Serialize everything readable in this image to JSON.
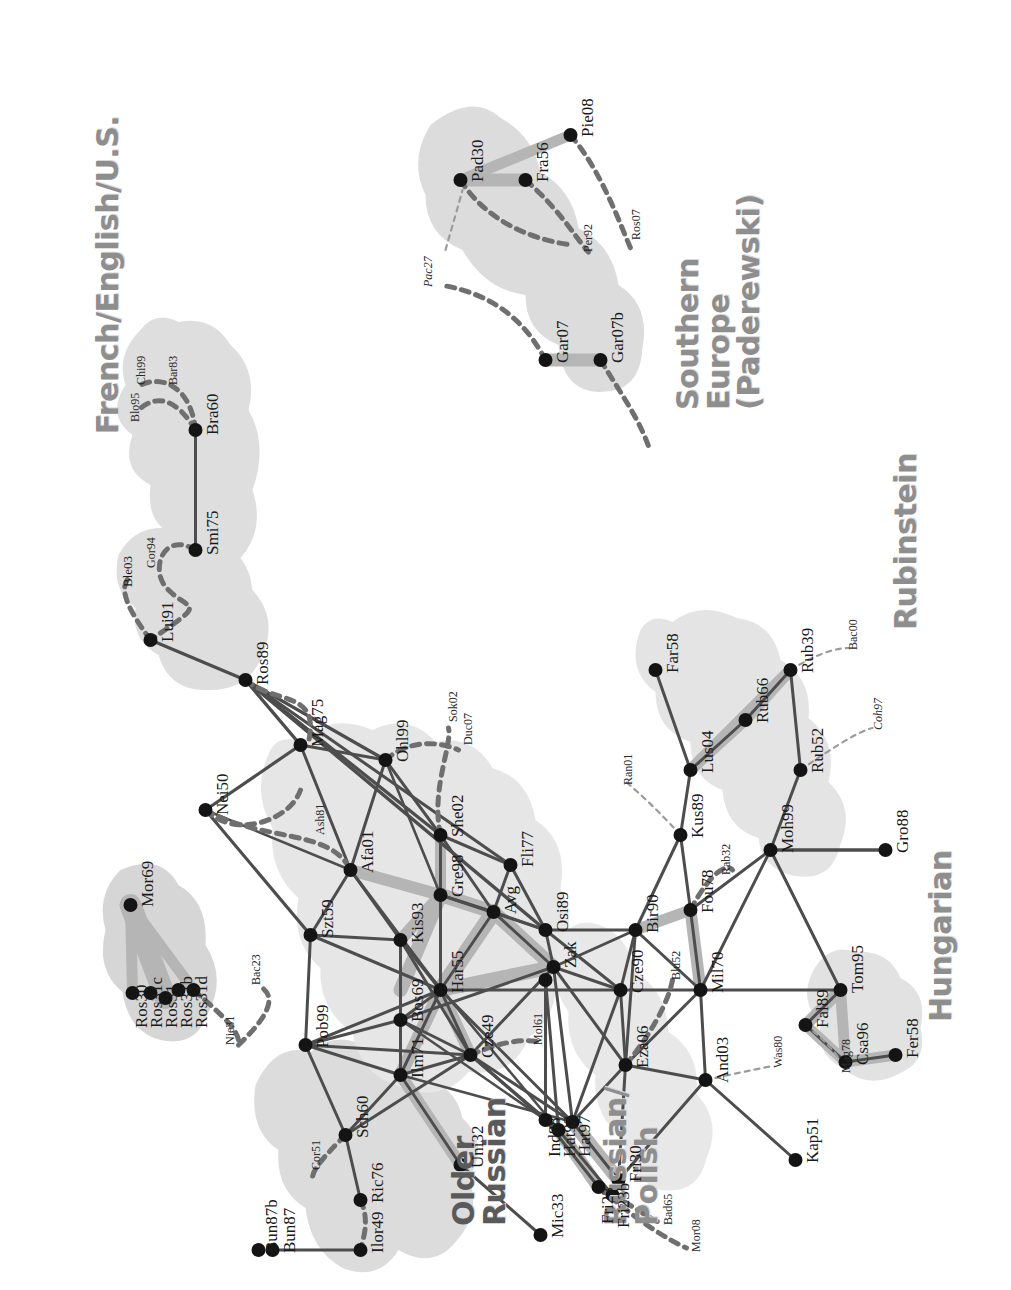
{
  "figure": {
    "type": "node-link-network-diagram",
    "orientation": "rotated-90-ccw",
    "background": "#ffffff",
    "palette": {
      "hull_light": "#e0e0e0",
      "hull_mid": "#d2d2d2",
      "hull_dark": "#c2c2c2",
      "edge_solid": "#4a4a4a",
      "edge_thick": "#6e6e6e",
      "edge_dashed": "#6b6b6b",
      "edge_thin_dashed": "#9a9a9a",
      "node_fill": "#161616",
      "group_label": "#8e8e8e",
      "node_label": "#1a1a1a"
    }
  },
  "groups": [
    {
      "id": "french",
      "label": "French/English/U.S.",
      "shade": "dark"
    },
    {
      "id": "southern",
      "label": "Southern\nEurope\n(Paderewski)",
      "shade": "dark"
    },
    {
      "id": "rubinstein",
      "label": "Rubinstein",
      "shade": "light"
    },
    {
      "id": "hungarian",
      "label": "Hungarian",
      "shade": "light"
    },
    {
      "id": "older_russian",
      "label": "Older\nRussian",
      "shade": "dark"
    },
    {
      "id": "russian_polish",
      "label": "Russian/\nPolish",
      "shade": "light"
    }
  ],
  "nodes": [
    {
      "id": "Bra60",
      "label": "Bra60",
      "x": 860,
      "y": 195,
      "r": 7
    },
    {
      "id": "Smi75",
      "label": "Smi75",
      "x": 740,
      "y": 195,
      "r": 7
    },
    {
      "id": "Ros89",
      "label": "Ros89",
      "x": 610,
      "y": 245,
      "r": 7
    },
    {
      "id": "Lui91",
      "label": "Lui91",
      "x": 650,
      "y": 150,
      "r": 7
    },
    {
      "id": "Mag75",
      "label": "Mag75",
      "x": 545,
      "y": 300,
      "r": 7
    },
    {
      "id": "Nei50",
      "label": "Nei50",
      "x": 480,
      "y": 205,
      "r": 7
    },
    {
      "id": "Ohl99",
      "label": "Ohl99",
      "x": 530,
      "y": 385,
      "r": 7
    },
    {
      "id": "She02",
      "label": "She02",
      "x": 455,
      "y": 440,
      "r": 7
    },
    {
      "id": "Afa01",
      "label": "Afa01",
      "x": 420,
      "y": 350,
      "r": 7
    },
    {
      "id": "Szt59",
      "label": "Szt59",
      "x": 355,
      "y": 310,
      "r": 7
    },
    {
      "id": "Kis93",
      "label": "Kis93",
      "x": 350,
      "y": 400,
      "r": 7
    },
    {
      "id": "Gre98",
      "label": "Gre98",
      "x": 395,
      "y": 440,
      "r": 7
    },
    {
      "id": "Fli77",
      "label": "Fli77",
      "x": 425,
      "y": 510,
      "r": 7
    },
    {
      "id": "Avg",
      "label": "Avg",
      "x": 378,
      "y": 493,
      "r": 7
    },
    {
      "id": "Osi89",
      "label": "Osi89",
      "x": 360,
      "y": 545,
      "r": 7
    },
    {
      "id": "Har55",
      "label": "Har55",
      "x": 300,
      "y": 440,
      "r": 7
    },
    {
      "id": "Bos69",
      "label": "Bos69",
      "x": 270,
      "y": 400,
      "r": 7
    },
    {
      "id": "Pob99",
      "label": "Pob99",
      "x": 245,
      "y": 305,
      "r": 7
    },
    {
      "id": "Ilm71",
      "label": "Ilm71",
      "x": 215,
      "y": 400,
      "r": 7
    },
    {
      "id": "Sch60",
      "label": "Sch60",
      "x": 155,
      "y": 345,
      "r": 7
    },
    {
      "id": "Cze49",
      "label": "Cze49",
      "x": 235,
      "y": 470,
      "r": 7
    },
    {
      "id": "Uni32",
      "label": "Uni32",
      "x": 125,
      "y": 460,
      "r": 7
    },
    {
      "id": "Mic33",
      "label": "Mic33",
      "x": 55,
      "y": 540,
      "r": 7
    },
    {
      "id": "Ric76",
      "label": "Ric76",
      "x": 90,
      "y": 360,
      "r": 7
    },
    {
      "id": "Ilor49",
      "label": "Ilor49",
      "x": 40,
      "y": 360,
      "r": 7
    },
    {
      "id": "Bun87",
      "label": "Bun87",
      "x": 40,
      "y": 272,
      "r": 7
    },
    {
      "id": "Bun87b",
      "label": "Bun87b",
      "x": 40,
      "y": 258,
      "r": 7
    },
    {
      "id": "Mor69",
      "label": "Mor69",
      "x": 385,
      "y": 130,
      "r": 7
    },
    {
      "id": "Ros30",
      "label": "Ros30",
      "x": 297,
      "y": 132,
      "r": 7
    },
    {
      "id": "Ros31c",
      "label": "Ros31c",
      "x": 297,
      "y": 150,
      "r": 7
    },
    {
      "id": "Ros31",
      "label": "Ros31",
      "x": 292,
      "y": 165,
      "r": 7
    },
    {
      "id": "Ros31b",
      "label": "Ros31b",
      "x": 300,
      "y": 178,
      "r": 7
    },
    {
      "id": "Ros31d",
      "label": "Ros31d",
      "x": 300,
      "y": 193,
      "r": 7
    },
    {
      "id": "Zak",
      "label": "Zak",
      "x": 323,
      "y": 553,
      "r": 7
    },
    {
      "id": "Zakb",
      "label": "Zak",
      "x": 310,
      "y": 545,
      "r": 7
    },
    {
      "id": "Cze90",
      "label": "Cze90",
      "x": 300,
      "y": 620,
      "r": 7
    },
    {
      "id": "Bir90",
      "label": "Bir90",
      "x": 360,
      "y": 635,
      "r": 7
    },
    {
      "id": "Eza06",
      "label": "Eza06",
      "x": 225,
      "y": 625,
      "r": 7
    },
    {
      "id": "Mil70",
      "label": "Mil70",
      "x": 300,
      "y": 700,
      "r": 7
    },
    {
      "id": "And03",
      "label": "And03",
      "x": 210,
      "y": 705,
      "r": 7
    },
    {
      "id": "Fou78",
      "label": "Fou78",
      "x": 380,
      "y": 690,
      "r": 7
    },
    {
      "id": "Kus89",
      "label": "Kus89",
      "x": 455,
      "y": 680,
      "r": 7
    },
    {
      "id": "Lus04",
      "label": "Lus04",
      "x": 520,
      "y": 690,
      "r": 7
    },
    {
      "id": "Rub66",
      "label": "Rub66",
      "x": 570,
      "y": 745,
      "r": 7
    },
    {
      "id": "Far58",
      "label": "Far58",
      "x": 620,
      "y": 655,
      "r": 7
    },
    {
      "id": "Rub39",
      "label": "Rub39",
      "x": 620,
      "y": 790,
      "r": 7
    },
    {
      "id": "Rub52",
      "label": "Rub52",
      "x": 520,
      "y": 800,
      "r": 7
    },
    {
      "id": "Moh99",
      "label": "Moh99",
      "x": 440,
      "y": 770,
      "r": 7
    },
    {
      "id": "Gro88",
      "label": "Gro88",
      "x": 440,
      "y": 885,
      "r": 7
    },
    {
      "id": "Tom95",
      "label": "Tom95",
      "x": 300,
      "y": 840,
      "r": 7
    },
    {
      "id": "Fer58",
      "label": "Fer58",
      "x": 235,
      "y": 895,
      "r": 7
    },
    {
      "id": "Csa96",
      "label": "Csa96",
      "x": 228,
      "y": 845,
      "r": 7
    },
    {
      "id": "Fal89",
      "label": "Fal89",
      "x": 265,
      "y": 805,
      "r": 7
    },
    {
      "id": "Kap51",
      "label": "Kap51",
      "x": 130,
      "y": 795,
      "r": 7
    },
    {
      "id": "Ind88",
      "label": "Ind88",
      "x": 170,
      "y": 545,
      "r": 7
    },
    {
      "id": "Hat93",
      "label": "Hat93",
      "x": 160,
      "y": 558,
      "r": 7
    },
    {
      "id": "Hat97",
      "label": "Hat97",
      "x": 168,
      "y": 572,
      "r": 7
    },
    {
      "id": "Fri23",
      "label": "Fri23",
      "x": 103,
      "y": 598,
      "r": 7
    },
    {
      "id": "Fri23b",
      "label": "Fri23b",
      "x": 95,
      "y": 612,
      "r": 7
    },
    {
      "id": "Fri30",
      "label": "Fri30",
      "x": 110,
      "y": 618,
      "r": 7
    },
    {
      "id": "Pad30",
      "label": "Pad30",
      "x": 1110,
      "y": 460,
      "r": 7
    },
    {
      "id": "Fra56",
      "label": "Fra56",
      "x": 1110,
      "y": 525,
      "r": 7
    },
    {
      "id": "Pie08",
      "label": "Pie08",
      "x": 1155,
      "y": 570,
      "r": 7
    },
    {
      "id": "Gar07",
      "label": "Gar07",
      "x": 930,
      "y": 545,
      "r": 7
    },
    {
      "id": "Gar07b",
      "label": "Gar07b",
      "x": 930,
      "y": 600,
      "r": 7
    }
  ],
  "node_labels": [
    {
      "text": "Bra60",
      "lx": 855,
      "ly": 203
    },
    {
      "text": "Smi75",
      "lx": 735,
      "ly": 203
    },
    {
      "text": "Ros89",
      "lx": 605,
      "ly": 253
    },
    {
      "text": "Lui91",
      "lx": 648,
      "ly": 158
    },
    {
      "text": "Ble03",
      "lx": 703,
      "ly": 120,
      "small": true
    },
    {
      "text": "Mag75",
      "lx": 543,
      "ly": 308
    },
    {
      "text": "Nei50",
      "lx": 475,
      "ly": 213
    },
    {
      "text": "Ohl99",
      "lx": 528,
      "ly": 393
    },
    {
      "text": "She02",
      "lx": 453,
      "ly": 448
    },
    {
      "text": "Afa01",
      "lx": 417,
      "ly": 358
    },
    {
      "text": "Szt59",
      "lx": 352,
      "ly": 318
    },
    {
      "text": "Kis93",
      "lx": 347,
      "ly": 408
    },
    {
      "text": "Gre98",
      "lx": 393,
      "ly": 448
    },
    {
      "text": "Fli77",
      "lx": 423,
      "ly": 518
    },
    {
      "text": "Avg",
      "lx": 376,
      "ly": 501
    },
    {
      "text": "Osi89",
      "lx": 358,
      "ly": 553
    },
    {
      "text": "Har55",
      "lx": 297,
      "ly": 448
    },
    {
      "text": "Bos69",
      "lx": 268,
      "ly": 408
    },
    {
      "text": "Pob99",
      "lx": 242,
      "ly": 313
    },
    {
      "text": "Ilm71",
      "lx": 212,
      "ly": 408
    },
    {
      "text": "Sch60",
      "lx": 152,
      "ly": 353
    },
    {
      "text": "Cze49",
      "lx": 232,
      "ly": 478
    },
    {
      "text": "Uni32",
      "lx": 122,
      "ly": 468
    },
    {
      "text": "Mic33",
      "lx": 52,
      "ly": 548
    },
    {
      "text": "Ric76",
      "lx": 87,
      "ly": 368
    },
    {
      "text": "Ilor49",
      "lx": 37,
      "ly": 368
    },
    {
      "text": "Bun87",
      "lx": 37,
      "ly": 280
    },
    {
      "text": "Bun87b",
      "lx": 37,
      "ly": 262
    },
    {
      "text": "Mor69",
      "lx": 383,
      "ly": 138
    },
    {
      "text": "Ros30",
      "lx": 262,
      "ly": 132
    },
    {
      "text": "Ros31c",
      "lx": 262,
      "ly": 147
    },
    {
      "text": "Ros31",
      "lx": 262,
      "ly": 162
    },
    {
      "text": "Ros31b",
      "lx": 262,
      "ly": 177
    },
    {
      "text": "Ros31d",
      "lx": 262,
      "ly": 192
    },
    {
      "text": "Zak",
      "lx": 322,
      "ly": 561
    },
    {
      "text": "Cze90",
      "lx": 297,
      "ly": 628
    },
    {
      "text": "Bir90",
      "lx": 357,
      "ly": 643
    },
    {
      "text": "Eza06",
      "lx": 222,
      "ly": 633
    },
    {
      "text": "Mil70",
      "lx": 297,
      "ly": 708
    },
    {
      "text": "And03",
      "lx": 207,
      "ly": 713
    },
    {
      "text": "Fou78",
      "lx": 377,
      "ly": 698
    },
    {
      "text": "Kus89",
      "lx": 452,
      "ly": 688
    },
    {
      "text": "Lus04",
      "lx": 517,
      "ly": 698
    },
    {
      "text": "Rub66",
      "lx": 567,
      "ly": 753
    },
    {
      "text": "Far58",
      "lx": 617,
      "ly": 663
    },
    {
      "text": "Rub39",
      "lx": 617,
      "ly": 798
    },
    {
      "text": "Rub52",
      "lx": 517,
      "ly": 808
    },
    {
      "text": "Moh99",
      "lx": 437,
      "ly": 778
    },
    {
      "text": "Gro88",
      "lx": 437,
      "ly": 893
    },
    {
      "text": "Tom95",
      "lx": 297,
      "ly": 848
    },
    {
      "text": "Fer58",
      "lx": 232,
      "ly": 903
    },
    {
      "text": "Csa96",
      "lx": 225,
      "ly": 853
    },
    {
      "text": "Fal89",
      "lx": 262,
      "ly": 813
    },
    {
      "text": "Kap51",
      "lx": 127,
      "ly": 803
    },
    {
      "text": "Ind88",
      "lx": 133,
      "ly": 545
    },
    {
      "text": "Hat93",
      "lx": 133,
      "ly": 560
    },
    {
      "text": "Hat97",
      "lx": 133,
      "ly": 575
    },
    {
      "text": "Fri23",
      "lx": 66,
      "ly": 598
    },
    {
      "text": "Fri23b",
      "lx": 62,
      "ly": 614
    },
    {
      "text": "Fri30",
      "lx": 108,
      "ly": 626
    },
    {
      "text": "Pad30",
      "lx": 1108,
      "ly": 468
    },
    {
      "text": "Fra56",
      "lx": 1108,
      "ly": 533
    },
    {
      "text": "Pie08",
      "lx": 1153,
      "ly": 578
    },
    {
      "text": "Gar07",
      "lx": 927,
      "ly": 553
    },
    {
      "text": "Gar07b",
      "lx": 927,
      "ly": 608
    }
  ],
  "edge_labels": [
    {
      "text": "Bar83",
      "lx": 905,
      "ly": 165,
      "italic": false
    },
    {
      "text": "Chi99",
      "lx": 905,
      "ly": 133,
      "italic": false
    },
    {
      "text": "Blo95",
      "lx": 868,
      "ly": 127,
      "italic": false
    },
    {
      "text": "Gor94",
      "lx": 722,
      "ly": 143,
      "italic": false
    },
    {
      "text": "Pac27",
      "lx": 1003,
      "ly": 420,
      "italic": true
    },
    {
      "text": "Per92",
      "lx": 1038,
      "ly": 580,
      "italic": false
    },
    {
      "text": "Ros07",
      "lx": 1050,
      "ly": 628,
      "italic": false
    },
    {
      "text": "Bac00",
      "lx": 640,
      "ly": 845,
      "italic": false
    },
    {
      "text": "Coh97",
      "lx": 560,
      "ly": 870,
      "italic": true
    },
    {
      "text": "Ran01",
      "lx": 505,
      "ly": 620,
      "italic": false
    },
    {
      "text": "Rab32",
      "lx": 415,
      "ly": 718,
      "italic": false
    },
    {
      "text": "Was80",
      "lx": 222,
      "ly": 770,
      "italic": false
    },
    {
      "text": "Mag78",
      "lx": 217,
      "ly": 838,
      "italic": false
    },
    {
      "text": "Blu52",
      "lx": 310,
      "ly": 668,
      "italic": false
    },
    {
      "text": "Mol61",
      "lx": 245,
      "ly": 530,
      "italic": false
    },
    {
      "text": "Bad65",
      "lx": 65,
      "ly": 660,
      "italic": false
    },
    {
      "text": "Mor08",
      "lx": 38,
      "ly": 688,
      "italic": false
    },
    {
      "text": "Nie31",
      "lx": 245,
      "ly": 222,
      "italic": false
    },
    {
      "text": "Bac23",
      "lx": 305,
      "ly": 248,
      "italic": false
    },
    {
      "text": "Cor51",
      "lx": 120,
      "ly": 308,
      "italic": false
    },
    {
      "text": "Ash81",
      "lx": 455,
      "ly": 312,
      "italic": false
    },
    {
      "text": "Sok02",
      "lx": 568,
      "ly": 445,
      "italic": false
    },
    {
      "text": "Duc07",
      "lx": 545,
      "ly": 460,
      "italic": false
    }
  ],
  "group_label_positions": [
    {
      "id": "french",
      "text": "French/English/U.S.",
      "lx": 1015,
      "ly": 110,
      "size": 29
    },
    {
      "id": "southern",
      "text": "Southern\nEurope\n(Paderewski)",
      "lx": 930,
      "ly": 700,
      "size": 29
    },
    {
      "id": "rubinstein",
      "text": "Rubinstein",
      "lx": 700,
      "ly": 905,
      "size": 29
    },
    {
      "id": "hungarian",
      "text": "Hungarian",
      "lx": 320,
      "ly": 940,
      "size": 29
    },
    {
      "id": "older_russian",
      "text": "Older\nRussian",
      "lx": 85,
      "ly": 480,
      "size": 29
    },
    {
      "id": "russian_polish",
      "text": "Russian/\nPolish",
      "lx": 85,
      "ly": 620,
      "size": 29
    }
  ],
  "counts": {
    "nodes_visible": 65,
    "clusters": 6
  }
}
